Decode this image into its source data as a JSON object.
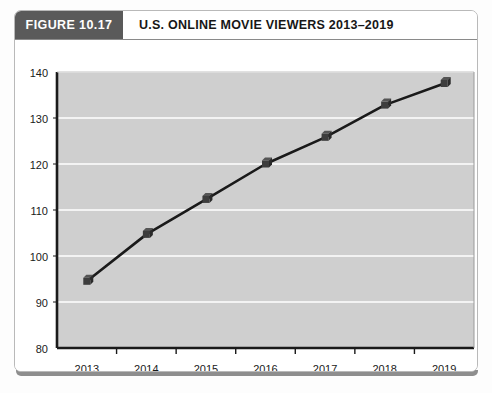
{
  "figure": {
    "tag": "FIGURE 10.17",
    "title": "U.S. ONLINE MOVIE VIEWERS 2013–2019"
  },
  "colors": {
    "tag_background": "#5a5a5a",
    "tag_text": "#ffffff",
    "plot_background": "#cfcfcf",
    "gridline": "#ffffff",
    "axis": "#1a1a1a",
    "series_line": "#1a1a1a",
    "marker_face": "#3d3d3d",
    "marker_top": "#555555",
    "marker_side": "#2a2a2a",
    "card_border": "#b9b9b9"
  },
  "chart_data": {
    "type": "line",
    "title": "U.S. ONLINE MOVIE VIEWERS 2013–2019",
    "xlabel": "",
    "ylabel": "",
    "categories": [
      "2013",
      "2014",
      "2015",
      "2016",
      "2017",
      "2018",
      "2019"
    ],
    "values": [
      94.5,
      104.7,
      112.3,
      120.0,
      125.8,
      132.8,
      137.5
    ],
    "series": [
      {
        "name": "U.S. Online Movie Viewers",
        "values": [
          94.5,
          104.7,
          112.3,
          120.0,
          125.8,
          132.8,
          137.5
        ]
      }
    ],
    "ylim": [
      80,
      140
    ],
    "yticks": [
      80,
      90,
      100,
      110,
      120,
      130,
      140
    ],
    "ytick_labels": [
      "80",
      "90",
      "100",
      "110",
      "120",
      "130",
      "140"
    ],
    "xtick_labels": [
      "2013",
      "2014",
      "2015",
      "2016",
      "2017",
      "2018",
      "2019"
    ],
    "grid": true,
    "grid_axis": "y",
    "legend": false,
    "legend_position": "none",
    "marker": "cube-3d"
  }
}
